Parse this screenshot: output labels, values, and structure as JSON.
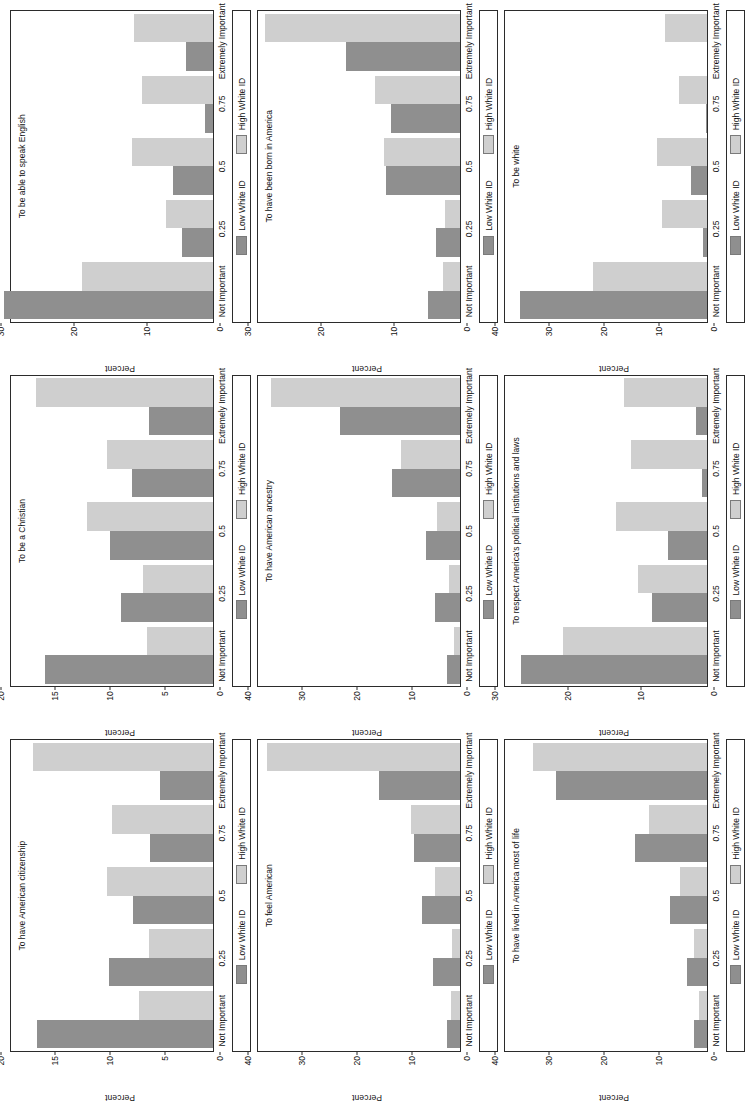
{
  "figure": {
    "legend": {
      "low_label": "Low White ID",
      "high_label": "High White ID",
      "low_color": "#8f8f8f",
      "high_color": "#cfcfcf"
    },
    "categories": [
      "Not Important",
      "0.25",
      "0.5",
      "0.75",
      "Extremely Important"
    ],
    "ylabel": "Percent"
  },
  "chart_data": [
    {
      "type": "bar",
      "title": "To have American citizenship",
      "xlabel": "",
      "ylabel": "Percent",
      "ylim": [
        0,
        20
      ],
      "yticks": [
        0,
        5,
        10,
        15,
        20
      ],
      "grid": false,
      "legend_position": "bottom",
      "categories": [
        "Not Important",
        "0.25",
        "0.5",
        "0.75",
        "Extremely Important"
      ],
      "series": [
        {
          "name": "Low White ID",
          "values": [
            17.4,
            10.3,
            7.9,
            6.2,
            5.2
          ]
        },
        {
          "name": "High White ID",
          "values": [
            7.3,
            6.3,
            10.5,
            10.0,
            17.8
          ]
        }
      ]
    },
    {
      "type": "bar",
      "title": "To be a Christian",
      "xlabel": "",
      "ylabel": "Percent",
      "ylim": [
        0,
        20
      ],
      "yticks": [
        0,
        5,
        10,
        15,
        20
      ],
      "grid": false,
      "legend_position": "bottom",
      "categories": [
        "Not Important",
        "0.25",
        "0.5",
        "0.75",
        "Extremely Important"
      ],
      "series": [
        {
          "name": "Low White ID",
          "values": [
            16.6,
            9.1,
            10.2,
            8.0,
            6.3
          ]
        },
        {
          "name": "High White ID",
          "values": [
            6.5,
            6.9,
            12.5,
            10.5,
            17.5
          ]
        }
      ]
    },
    {
      "type": "bar",
      "title": "To be able to speak English",
      "xlabel": "",
      "ylabel": "Percent",
      "ylim": [
        0,
        30
      ],
      "yticks": [
        0,
        10,
        20,
        30
      ],
      "grid": false,
      "legend_position": "bottom",
      "categories": [
        "Not Important",
        "0.25",
        "0.5",
        "0.75",
        "Extremely Important"
      ],
      "series": [
        {
          "name": "Low White ID",
          "values": [
            31.0,
            4.6,
            6.0,
            1.2,
            4.0
          ]
        },
        {
          "name": "High White ID",
          "values": [
            19.4,
            7.0,
            12.0,
            10.5,
            11.8
          ]
        }
      ]
    },
    {
      "type": "bar",
      "title": "To feel American",
      "xlabel": "",
      "ylabel": "Percent",
      "ylim": [
        0,
        40
      ],
      "yticks": [
        0,
        10,
        20,
        30,
        40
      ],
      "grid": false,
      "legend_position": "bottom",
      "categories": [
        "Not Important",
        "0.25",
        "0.5",
        "0.75",
        "Extremely Important"
      ],
      "series": [
        {
          "name": "Low White ID",
          "values": [
            2.5,
            5.3,
            7.5,
            9.2,
            16.0
          ]
        },
        {
          "name": "High White ID",
          "values": [
            1.8,
            1.5,
            5.0,
            9.7,
            38.3
          ]
        }
      ]
    },
    {
      "type": "bar",
      "title": "To have American ancestry",
      "xlabel": "",
      "ylabel": "Percent",
      "ylim": [
        0,
        40
      ],
      "yticks": [
        0,
        10,
        20,
        30,
        40
      ],
      "grid": false,
      "legend_position": "bottom",
      "categories": [
        "Not Important",
        "0.25",
        "0.5",
        "0.75",
        "Extremely Important"
      ],
      "series": [
        {
          "name": "Low White ID",
          "values": [
            2.6,
            5.0,
            6.7,
            13.4,
            23.8
          ]
        },
        {
          "name": "High White ID",
          "values": [
            1.2,
            2.2,
            4.6,
            11.6,
            37.5
          ]
        }
      ]
    },
    {
      "type": "bar",
      "title": "To have been born in America",
      "xlabel": "",
      "ylabel": "Percent",
      "ylim": [
        0,
        30
      ],
      "yticks": [
        0,
        10,
        20,
        30
      ],
      "grid": false,
      "legend_position": "bottom",
      "categories": [
        "Not Important",
        "0.25",
        "0.5",
        "0.75",
        "Extremely Important"
      ],
      "series": [
        {
          "name": "Low White ID",
          "values": [
            4.8,
            3.6,
            11.0,
            10.2,
            17.0
          ]
        },
        {
          "name": "High White ID",
          "values": [
            2.6,
            2.2,
            11.3,
            12.6,
            29.0
          ]
        }
      ]
    },
    {
      "type": "bar",
      "title": "To have lived in America most of life",
      "xlabel": "",
      "ylabel": "Percent",
      "ylim": [
        0,
        40
      ],
      "yticks": [
        0,
        10,
        20,
        30,
        40
      ],
      "grid": false,
      "legend_position": "bottom",
      "categories": [
        "Not Important",
        "0.25",
        "0.5",
        "0.75",
        "Extremely Important"
      ],
      "series": [
        {
          "name": "Low White ID",
          "values": [
            2.6,
            4.0,
            7.3,
            14.3,
            30.0
          ]
        },
        {
          "name": "High White ID",
          "values": [
            1.5,
            2.6,
            5.4,
            11.5,
            34.4
          ]
        }
      ]
    },
    {
      "type": "bar",
      "title": "To respect America's political institutions and laws",
      "xlabel": "",
      "ylabel": "Percent",
      "ylim": [
        0,
        30
      ],
      "yticks": [
        0,
        10,
        20,
        30
      ],
      "grid": false,
      "legend_position": "bottom",
      "categories": [
        "Not Important",
        "0.25",
        "0.5",
        "0.75",
        "Extremely Important"
      ],
      "series": [
        {
          "name": "Low White ID",
          "values": [
            27.6,
            8.1,
            5.8,
            0.8,
            1.6
          ]
        },
        {
          "name": "High White ID",
          "values": [
            21.4,
            10.3,
            13.5,
            11.3,
            12.3
          ]
        }
      ]
    },
    {
      "type": "bar",
      "title": "To be white",
      "xlabel": "",
      "ylabel": "Percent",
      "ylim": [
        0,
        40
      ],
      "yticks": [
        0,
        10,
        20,
        30,
        40
      ],
      "grid": false,
      "legend_position": "bottom",
      "categories": [
        "Not Important",
        "0.25",
        "0.5",
        "0.75",
        "Extremely Important"
      ],
      "series": [
        {
          "name": "Low White ID",
          "values": [
            37.0,
            0.7,
            3.2,
            0.3,
            0.0
          ]
        },
        {
          "name": "High White ID",
          "values": [
            22.6,
            9.0,
            10.0,
            5.6,
            8.3
          ]
        }
      ]
    }
  ]
}
